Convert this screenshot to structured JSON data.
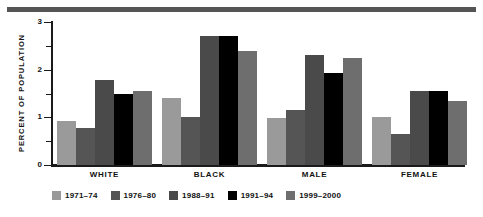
{
  "chart_data": {
    "type": "bar",
    "title": "",
    "xlabel": "",
    "ylabel": "Percent of Population",
    "ylim": [
      0,
      3
    ],
    "yticks": [
      "0",
      "1",
      "2",
      "3"
    ],
    "minor_tick_interval": 0.5,
    "grid": false,
    "legend_position": "bottom",
    "categories": [
      "White",
      "Black",
      "Male",
      "Female"
    ],
    "series": [
      {
        "name": "1971–74",
        "color": "#9a9a9a",
        "values": [
          0.93,
          1.4,
          0.98,
          1.0
        ]
      },
      {
        "name": "1976–80",
        "color": "#555555",
        "values": [
          0.77,
          1.0,
          1.15,
          0.65
        ]
      },
      {
        "name": "1988–91",
        "color": "#4a4a4a",
        "values": [
          1.78,
          2.7,
          2.3,
          1.55
        ]
      },
      {
        "name": "1991–94",
        "color": "#000000",
        "values": [
          1.48,
          2.7,
          1.93,
          1.55
        ]
      },
      {
        "name": "1999–2000",
        "color": "#6e6e6e",
        "values": [
          1.55,
          2.4,
          2.25,
          1.35
        ]
      }
    ]
  },
  "axis": {
    "y_title": "PERCENT OF POPULATION",
    "tick_labels": [
      "3",
      "2",
      "1",
      "0"
    ]
  },
  "category_labels": [
    "WHITE",
    "BLACK",
    "MALE",
    "FEMALE"
  ],
  "legend": {
    "items": [
      {
        "label": "1971–74"
      },
      {
        "label": "1976–80"
      },
      {
        "label": "1988–91"
      },
      {
        "label": "1991–94"
      },
      {
        "label": "1999–2000"
      }
    ]
  },
  "style": {
    "rule_color": "#555555",
    "axis_color": "#1a1a1a",
    "background": "#ffffff"
  }
}
